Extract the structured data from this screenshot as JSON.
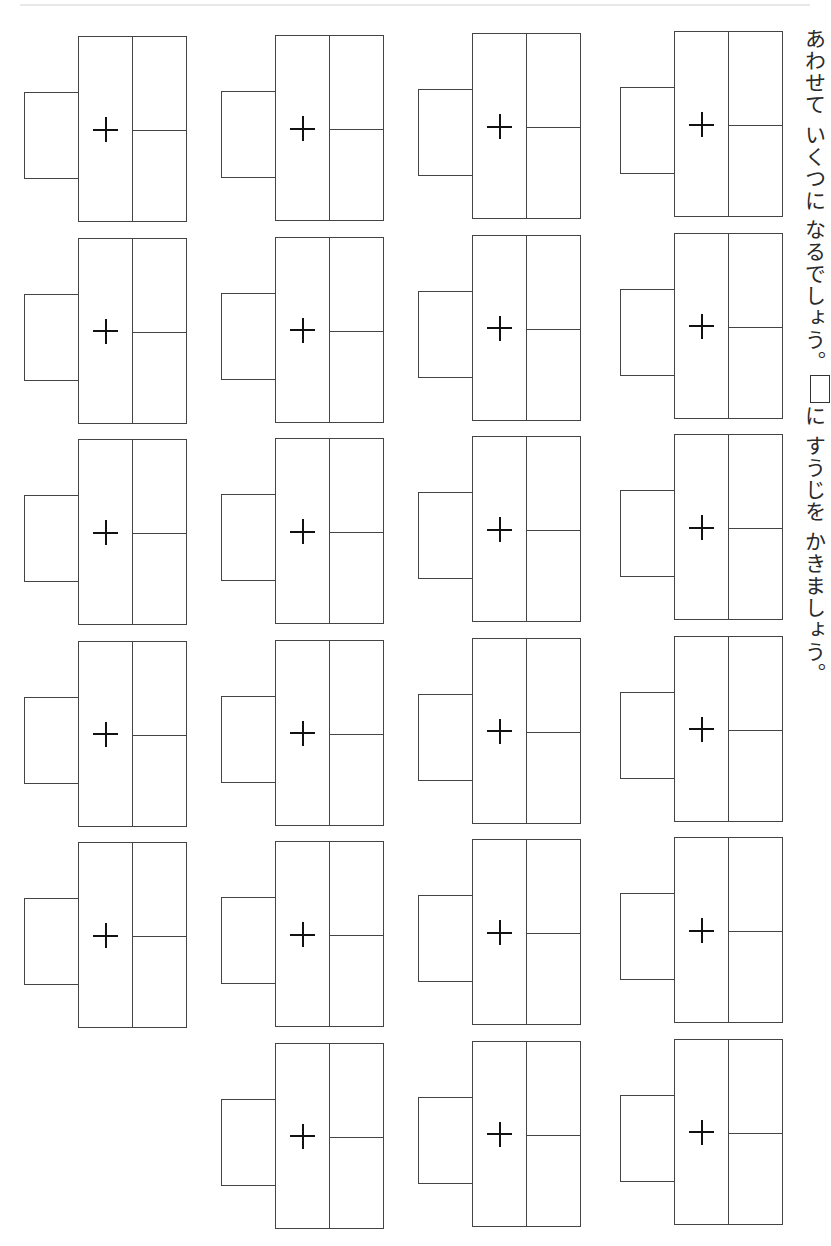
{
  "page": {
    "instruction_part1": "あわせて いくつに なるでしょう。",
    "instruction_part2": "に すうじを かきましょう。",
    "operator_symbol": "+",
    "line_color": "#444444"
  },
  "columns": [
    {
      "id": "col-1",
      "problem_count": 6
    },
    {
      "id": "col-2",
      "problem_count": 6
    },
    {
      "id": "col-3",
      "problem_count": 6
    },
    {
      "id": "col-4",
      "problem_count": 5
    }
  ],
  "problems": [
    {
      "col": 1,
      "row": 1,
      "answer": "",
      "top": "",
      "bottom": ""
    },
    {
      "col": 1,
      "row": 2,
      "answer": "",
      "top": "",
      "bottom": ""
    },
    {
      "col": 1,
      "row": 3,
      "answer": "",
      "top": "",
      "bottom": ""
    },
    {
      "col": 1,
      "row": 4,
      "answer": "",
      "top": "",
      "bottom": ""
    },
    {
      "col": 1,
      "row": 5,
      "answer": "",
      "top": "",
      "bottom": ""
    },
    {
      "col": 1,
      "row": 6,
      "answer": "",
      "top": "",
      "bottom": ""
    },
    {
      "col": 2,
      "row": 1,
      "answer": "",
      "top": "",
      "bottom": ""
    },
    {
      "col": 2,
      "row": 2,
      "answer": "",
      "top": "",
      "bottom": ""
    },
    {
      "col": 2,
      "row": 3,
      "answer": "",
      "top": "",
      "bottom": ""
    },
    {
      "col": 2,
      "row": 4,
      "answer": "",
      "top": "",
      "bottom": ""
    },
    {
      "col": 2,
      "row": 5,
      "answer": "",
      "top": "",
      "bottom": ""
    },
    {
      "col": 2,
      "row": 6,
      "answer": "",
      "top": "",
      "bottom": ""
    },
    {
      "col": 3,
      "row": 1,
      "answer": "",
      "top": "",
      "bottom": ""
    },
    {
      "col": 3,
      "row": 2,
      "answer": "",
      "top": "",
      "bottom": ""
    },
    {
      "col": 3,
      "row": 3,
      "answer": "",
      "top": "",
      "bottom": ""
    },
    {
      "col": 3,
      "row": 4,
      "answer": "",
      "top": "",
      "bottom": ""
    },
    {
      "col": 3,
      "row": 5,
      "answer": "",
      "top": "",
      "bottom": ""
    },
    {
      "col": 3,
      "row": 6,
      "answer": "",
      "top": "",
      "bottom": ""
    },
    {
      "col": 4,
      "row": 1,
      "answer": "",
      "top": "",
      "bottom": ""
    },
    {
      "col": 4,
      "row": 2,
      "answer": "",
      "top": "",
      "bottom": ""
    },
    {
      "col": 4,
      "row": 3,
      "answer": "",
      "top": "",
      "bottom": ""
    },
    {
      "col": 4,
      "row": 4,
      "answer": "",
      "top": "",
      "bottom": ""
    },
    {
      "col": 4,
      "row": 5,
      "answer": "",
      "top": "",
      "bottom": ""
    }
  ]
}
